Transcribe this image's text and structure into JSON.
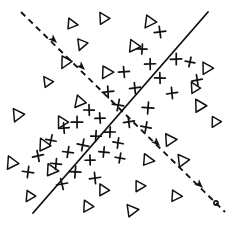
{
  "figure": {
    "title": "",
    "caption": "",
    "background_color": "#ffffff",
    "ink_color": "#111111",
    "width": 234,
    "height": 226
  },
  "chart_data": {
    "type": "scatter",
    "title": "",
    "subtitle": "",
    "xlabel": "",
    "ylabel": "",
    "xlim": [
      0,
      234
    ],
    "ylim": [
      0,
      226
    ],
    "grid": false,
    "legend": null,
    "axes_visible": false,
    "tick_labels": [],
    "annotations": [],
    "series": [
      {
        "name": "plus",
        "marker": "plus",
        "count": 34,
        "points": [
          [
            160,
            32
          ],
          [
            142,
            49
          ],
          [
            176,
            59
          ],
          [
            150,
            64
          ],
          [
            190,
            62
          ],
          [
            124,
            72
          ],
          [
            160,
            78
          ],
          [
            197,
            80
          ],
          [
            135,
            88
          ],
          [
            108,
            92
          ],
          [
            172,
            93
          ],
          [
            118,
            105
          ],
          [
            148,
            108
          ],
          [
            89,
            110
          ],
          [
            100,
            118
          ],
          [
            77,
            122
          ],
          [
            129,
            122
          ],
          [
            64,
            128
          ],
          [
            110,
            132
          ],
          [
            146,
            127
          ],
          [
            96,
            136
          ],
          [
            51,
            140
          ],
          [
            83,
            145
          ],
          [
            118,
            143
          ],
          [
            68,
            152
          ],
          [
            104,
            152
          ],
          [
            38,
            156
          ],
          [
            90,
            160
          ],
          [
            56,
            164
          ],
          [
            120,
            158
          ],
          [
            75,
            172
          ],
          [
            28,
            172
          ],
          [
            95,
            178
          ],
          [
            62,
            184
          ]
        ]
      },
      {
        "name": "triangle",
        "marker": "triangle-right",
        "count": 27,
        "points": [
          [
            72,
            24
          ],
          [
            104,
            18
          ],
          [
            150,
            22
          ],
          [
            82,
            44
          ],
          [
            134,
            46
          ],
          [
            48,
            82
          ],
          [
            107,
            72
          ],
          [
            80,
            102
          ],
          [
            18,
            115
          ],
          [
            62,
            122
          ],
          [
            207,
            68
          ],
          [
            195,
            88
          ],
          [
            200,
            106
          ],
          [
            44,
            145
          ],
          [
            170,
            140
          ],
          [
            12,
            163
          ],
          [
            52,
            170
          ],
          [
            104,
            190
          ],
          [
            140,
            186
          ],
          [
            88,
            206
          ],
          [
            132,
            210
          ],
          [
            176,
            196
          ],
          [
            216,
            122
          ],
          [
            30,
            196
          ],
          [
            183,
            160
          ],
          [
            148,
            160
          ],
          [
            66,
            62
          ]
        ]
      }
    ],
    "lines": [
      {
        "name": "solid-boundary",
        "style": "solid",
        "x1": 33,
        "y1": 213,
        "x2": 208,
        "y2": 12,
        "arrow": false
      },
      {
        "name": "dashed-boundary",
        "style": "dashed",
        "x1": 21,
        "y1": 12,
        "x2": 225,
        "y2": 212,
        "arrow": true,
        "arrow_positions": [
          [
            57,
            43
          ],
          [
            85,
            70
          ],
          [
            160,
            146
          ],
          [
            203,
            188
          ]
        ],
        "endcap": "small-circle"
      }
    ]
  }
}
